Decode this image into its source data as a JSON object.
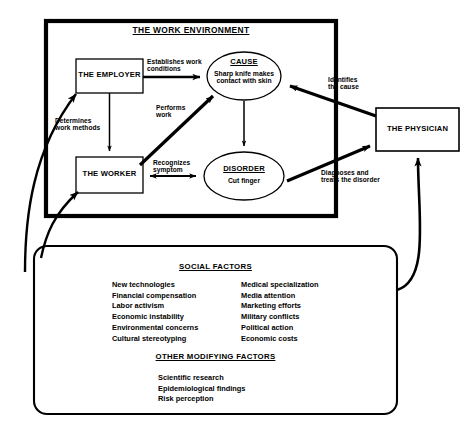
{
  "diagram": {
    "title": "THE WORK ENVIRONMENT",
    "frame_label": "THE WORK ENVIRONMENT"
  },
  "nodes": {
    "employer": {
      "label": "THE EMPLOYER"
    },
    "worker": {
      "label": "THE WORKER"
    },
    "physician": {
      "label": "THE PHYSICIAN"
    },
    "cause": {
      "title": "CAUSE",
      "detail_line1": "Sharp knife makes",
      "detail_line2": "contact with skin"
    },
    "disorder": {
      "title": "DISORDER",
      "detail_line1": "Cut finger"
    }
  },
  "edges": {
    "establishes": {
      "line1": "Establishes work",
      "line2": "conditions"
    },
    "determines": {
      "line1": "Determines",
      "line2": "work methods"
    },
    "performs": {
      "line1": "Performs",
      "line2": "work"
    },
    "recognizes": {
      "line1": "Recognizes",
      "line2": "symptom"
    },
    "identifies": {
      "line1": "Identifies",
      "line2": "the cause"
    },
    "diagnoses": {
      "line1": "Diagnoses and",
      "line2": "treats the disorder"
    }
  },
  "social_panel": {
    "heading": "SOCIAL FACTORS",
    "column_left": [
      "New technologies",
      "Financial compensation",
      "Labor activism",
      "Economic instability",
      "Environmental concerns",
      "Cultural stereotyping"
    ],
    "column_right": [
      "Medical specialization",
      "Media attention",
      "Marketing efforts",
      "Military conflicts",
      "Political action",
      "Economic costs"
    ],
    "secondary_heading": "OTHER MODIFYING FACTORS",
    "secondary_items": [
      "Scientific research",
      "Epidemiological findings",
      "Risk perception"
    ]
  },
  "colors": {
    "ink": "#000000",
    "paper": "#ffffff"
  }
}
